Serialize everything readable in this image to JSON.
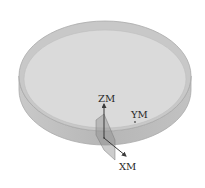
{
  "figure": {
    "axes": {
      "z_label": "ZM",
      "y_label": "YM",
      "x_label": "XM"
    },
    "colors": {
      "top_face": "#d9d9d9",
      "rim_face": "#c4c4c4",
      "side_face": "#b8b8b8",
      "outline": "#a9a9a9",
      "axis": "#3a3a3a",
      "plane": "#8e8e8e"
    }
  }
}
